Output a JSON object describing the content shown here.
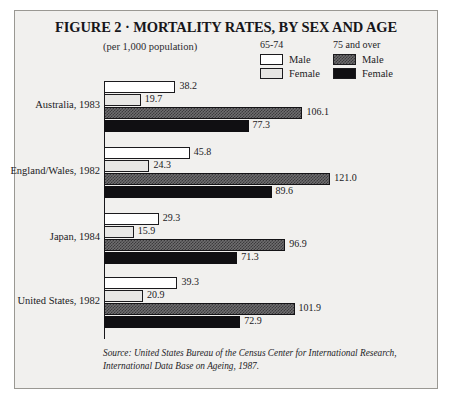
{
  "figure": {
    "title": "FIGURE 2 · MORTALITY RATES, BY SEX AND AGE",
    "subtitle": "(per  1,000  population)",
    "source": "Source: United States Bureau of the Census Center for International Research, International Data Base on Ageing, 1987."
  },
  "legend": {
    "groups": [
      {
        "heading": "65-74",
        "entries": [
          {
            "label": "Male",
            "swatch": "white-swatch"
          },
          {
            "label": "Female",
            "swatch": "light-gray-swatch"
          }
        ]
      },
      {
        "heading": "75 and over",
        "entries": [
          {
            "label": "Male",
            "swatch": "stippled-gray-swatch"
          },
          {
            "label": "Female",
            "swatch": "black-swatch"
          }
        ]
      }
    ]
  },
  "chart_data": {
    "type": "bar",
    "orientation": "horizontal",
    "title": "FIGURE 2 · MORTALITY RATES, BY SEX AND AGE",
    "subtitle": "(per  1,000  population)",
    "xlabel": "",
    "ylabel": "",
    "unit": "deaths per 1,000 population",
    "grid": false,
    "legend_position": "top-right",
    "xlim": [
      0,
      130
    ],
    "categories": [
      "Australia, 1983",
      "England/Wales, 1982",
      "Japan, 1984",
      "United States, 1982"
    ],
    "series": [
      {
        "name": "65-74 Male",
        "values": [
          38.2,
          45.8,
          29.3,
          39.3
        ]
      },
      {
        "name": "65-74 Female",
        "values": [
          19.7,
          24.3,
          15.9,
          20.9
        ]
      },
      {
        "name": "75 and over Male",
        "values": [
          106.1,
          121.0,
          96.9,
          101.9
        ]
      },
      {
        "name": "75 and over Female",
        "values": [
          77.3,
          89.6,
          71.3,
          72.9
        ]
      }
    ],
    "groups": [
      {
        "label": "Australia, 1983",
        "bars": [
          {
            "series": "65-74 Male",
            "value": 38.2,
            "display": "38.2",
            "style": "b-white"
          },
          {
            "series": "65-74 Female",
            "value": 19.7,
            "display": "19.7",
            "style": "b-light"
          },
          {
            "series": "75 and over Male",
            "value": 106.1,
            "display": "106.1",
            "style": "b-stipple"
          },
          {
            "series": "75 and over Female",
            "value": 77.3,
            "display": "77.3",
            "style": "b-black"
          }
        ]
      },
      {
        "label": "England/Wales, 1982",
        "bars": [
          {
            "series": "65-74 Male",
            "value": 45.8,
            "display": "45.8",
            "style": "b-white"
          },
          {
            "series": "65-74 Female",
            "value": 24.3,
            "display": "24.3",
            "style": "b-light"
          },
          {
            "series": "75 and over Male",
            "value": 121.0,
            "display": "121.0",
            "style": "b-stipple"
          },
          {
            "series": "75 and over Female",
            "value": 89.6,
            "display": "89.6",
            "style": "b-black"
          }
        ]
      },
      {
        "label": "Japan, 1984",
        "bars": [
          {
            "series": "65-74 Male",
            "value": 29.3,
            "display": "29.3",
            "style": "b-white"
          },
          {
            "series": "65-74 Female",
            "value": 15.9,
            "display": "15.9",
            "style": "b-light"
          },
          {
            "series": "75 and over Male",
            "value": 96.9,
            "display": "96.9",
            "style": "b-stipple"
          },
          {
            "series": "75 and over Female",
            "value": 71.3,
            "display": "71.3",
            "style": "b-black"
          }
        ]
      },
      {
        "label": "United States, 1982",
        "bars": [
          {
            "series": "65-74 Male",
            "value": 39.3,
            "display": "39.3",
            "style": "b-white"
          },
          {
            "series": "65-74 Female",
            "value": 20.9,
            "display": "20.9",
            "style": "b-light"
          },
          {
            "series": "75 and over Male",
            "value": 101.9,
            "display": "101.9",
            "style": "b-stipple"
          },
          {
            "series": "75 and over Female",
            "value": 72.9,
            "display": "72.9",
            "style": "b-black"
          }
        ]
      }
    ]
  },
  "colors": {
    "frame_background": "#f1f0ee",
    "frame_border": "#9a9893",
    "ink": "#17161a",
    "bar_white": "#ffffff",
    "bar_light": "#e8e7e5",
    "bar_stipple": "#6e6d6f",
    "bar_black": "#100f12"
  },
  "scale": {
    "pixels_per_unit": 1.87,
    "axis_x": 89
  }
}
